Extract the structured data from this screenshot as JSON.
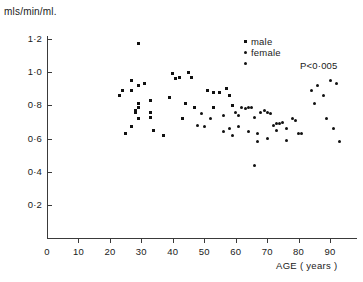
{
  "chart_data": {
    "type": "scatter",
    "title": "",
    "xlabel": "AGE ( years )",
    "ylabel": "mls/min/ml.",
    "xlim": [
      0,
      95
    ],
    "ylim": [
      0,
      1.3
    ],
    "xticks": [
      0,
      10,
      20,
      30,
      40,
      50,
      60,
      70,
      80,
      90
    ],
    "xtick_labels": [
      "0",
      "10",
      "20",
      "30",
      "40",
      "50",
      "60",
      "70",
      "80",
      "90"
    ],
    "yticks": [
      0.2,
      0.4,
      0.6,
      0.8,
      1.0,
      1.2
    ],
    "ytick_labels": [
      "0·2",
      "0·4",
      "0·6",
      "0·8",
      "1·0",
      "1·2"
    ],
    "grid": false,
    "legend_position": "top-right",
    "annotations": [
      {
        "text": "P<0·005",
        "x": 88,
        "y": 1.06
      }
    ],
    "series": [
      {
        "name": "male",
        "marker": "square",
        "color": "#111111",
        "points": [
          [
            29,
            1.17
          ],
          [
            27,
            0.95
          ],
          [
            29,
            0.92
          ],
          [
            31,
            0.93
          ],
          [
            24,
            0.89
          ],
          [
            27,
            0.89
          ],
          [
            23,
            0.86
          ],
          [
            29,
            0.81
          ],
          [
            29,
            0.79
          ],
          [
            28,
            0.77
          ],
          [
            28,
            0.76
          ],
          [
            29,
            0.72
          ],
          [
            27,
            0.67
          ],
          [
            25,
            0.63
          ],
          [
            33,
            0.83
          ],
          [
            33,
            0.76
          ],
          [
            33,
            0.73
          ],
          [
            34,
            0.65
          ],
          [
            37,
            0.62
          ],
          [
            40,
            0.99
          ],
          [
            41,
            0.96
          ],
          [
            42,
            0.97
          ],
          [
            39,
            0.85
          ],
          [
            45,
            1.0
          ],
          [
            46,
            0.97
          ],
          [
            44,
            0.81
          ],
          [
            47,
            0.79
          ],
          [
            43,
            0.72
          ],
          [
            51,
            0.89
          ],
          [
            53,
            0.88
          ],
          [
            55,
            0.88
          ],
          [
            57,
            0.9
          ],
          [
            58,
            0.86
          ],
          [
            53,
            0.79
          ],
          [
            59,
            0.8
          ]
        ]
      },
      {
        "name": "female",
        "marker": "circle",
        "color": "#111111",
        "points": [
          [
            49,
            0.75
          ],
          [
            52,
            0.72
          ],
          [
            56,
            0.74
          ],
          [
            60,
            0.76
          ],
          [
            62,
            0.79
          ],
          [
            63,
            0.78
          ],
          [
            64,
            0.79
          ],
          [
            65,
            0.79
          ],
          [
            61,
            0.74
          ],
          [
            66,
            0.73
          ],
          [
            68,
            0.76
          ],
          [
            69,
            0.77
          ],
          [
            70,
            0.76
          ],
          [
            71,
            0.75
          ],
          [
            66,
            0.44
          ],
          [
            64,
            0.64
          ],
          [
            67,
            0.63
          ],
          [
            72,
            0.68
          ],
          [
            73,
            0.69
          ],
          [
            74,
            0.69
          ],
          [
            75,
            0.7
          ],
          [
            73,
            0.65
          ],
          [
            76,
            0.66
          ],
          [
            78,
            0.72
          ],
          [
            79,
            0.71
          ],
          [
            80,
            0.63
          ],
          [
            81,
            0.63
          ],
          [
            84,
            0.89
          ],
          [
            86,
            0.92
          ],
          [
            85,
            0.81
          ],
          [
            88,
            0.86
          ],
          [
            90,
            0.95
          ],
          [
            92,
            0.93
          ],
          [
            89,
            0.72
          ],
          [
            91,
            0.66
          ],
          [
            93,
            0.58
          ],
          [
            63,
            1.05
          ],
          [
            59,
            0.62
          ],
          [
            67,
            0.58
          ],
          [
            70,
            0.6
          ],
          [
            76,
            0.59
          ],
          [
            56,
            0.64
          ],
          [
            50,
            0.67
          ],
          [
            48,
            0.68
          ],
          [
            61,
            0.67
          ],
          [
            58,
            0.66
          ]
        ]
      }
    ],
    "legend": [
      "male",
      "female"
    ]
  },
  "legend": {
    "male_label": "male",
    "female_label": "female"
  },
  "axes": {
    "y_title": "mls/min/ml.",
    "x_title": "AGE ( years )"
  },
  "annotation": {
    "p_value": "P<0·005"
  },
  "colors": {
    "marker": "#111111",
    "axis": "#3a3a3a",
    "background": "#ffffff"
  }
}
